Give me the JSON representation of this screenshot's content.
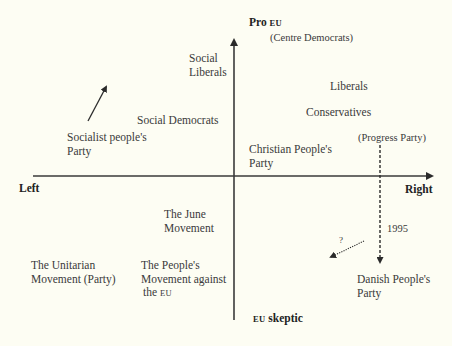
{
  "diagram": {
    "type": "two-axis positioning map",
    "axes": {
      "vertical": {
        "top_label": "Pro",
        "top_label_sc": "EU",
        "bottom_label_sc": "EU",
        "bottom_label": "skeptic"
      },
      "horizontal": {
        "left_label": "Left",
        "right_label": "Right"
      }
    },
    "parties": [
      {
        "id": "centre_democrats",
        "lines": [
          "(Centre Democrats)"
        ]
      },
      {
        "id": "social_liberals",
        "lines": [
          "Social",
          "Liberals"
        ]
      },
      {
        "id": "liberals",
        "lines": [
          "Liberals"
        ]
      },
      {
        "id": "conservatives",
        "lines": [
          "Conservatives"
        ]
      },
      {
        "id": "progress_party",
        "lines": [
          "(Progress Party)"
        ]
      },
      {
        "id": "social_democrats",
        "lines": [
          "Social Democrats"
        ]
      },
      {
        "id": "socialist_peoples_party",
        "lines": [
          "Socialist people's",
          "Party"
        ]
      },
      {
        "id": "christian_peoples_party",
        "lines": [
          "Christian People's",
          "Party"
        ]
      },
      {
        "id": "june_movement",
        "lines": [
          "The June",
          "Movement"
        ]
      },
      {
        "id": "unitarian_movement",
        "lines": [
          "The Unitarian",
          "Movement (Party)"
        ]
      },
      {
        "id": "peoples_movement",
        "lines": [
          "The People's",
          "Movement against",
          "the"
        ],
        "suffix_sc": "EU"
      },
      {
        "id": "danish_peoples_party",
        "lines": [
          "Danish People's",
          "Party"
        ]
      }
    ],
    "annotations": {
      "year": "1995",
      "question": "?"
    },
    "arrows": [
      {
        "name": "socialist-shift-arrow",
        "style": "solid",
        "from": [
          88,
          121
        ],
        "to": [
          108,
          84
        ]
      },
      {
        "name": "progress-to-danish-arrow",
        "style": "dashed",
        "from": [
          380,
          145
        ],
        "to": [
          380,
          266
        ]
      },
      {
        "name": "uncertain-shift-arrow",
        "style": "dotted",
        "from": [
          364,
          241
        ],
        "to": [
          328,
          258
        ]
      }
    ]
  }
}
